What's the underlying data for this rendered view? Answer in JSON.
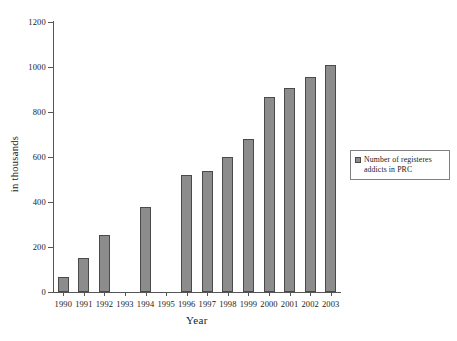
{
  "chart_data": {
    "type": "bar",
    "title": "",
    "xlabel": "Year",
    "ylabel": "in thousands",
    "categories": [
      "1990",
      "1991",
      "1992",
      "1993",
      "1994",
      "1995",
      "1996",
      "1997",
      "1998",
      "1999",
      "2000",
      "2001",
      "2002",
      "2003"
    ],
    "values": [
      68,
      150,
      252,
      null,
      380,
      null,
      520,
      540,
      600,
      681,
      866,
      906,
      955,
      1010
    ],
    "series": [
      {
        "name": "Number of registeres addicts in PRC",
        "values": [
          68,
          150,
          252,
          null,
          380,
          null,
          520,
          540,
          600,
          681,
          866,
          906,
          955,
          1010
        ]
      }
    ],
    "ylim": [
      0,
      1200
    ],
    "yticks": [
      0,
      200,
      400,
      600,
      800,
      1000,
      1200
    ],
    "ytick_labels": [
      "0",
      "200",
      "400",
      "600",
      "800",
      "1000",
      "1200"
    ],
    "grid": false,
    "legend_position": "right",
    "bar_color": "#8c8c8c",
    "bar_edge_color": "#4a4a4a",
    "axis_color": "#555555"
  },
  "legend": {
    "entries": [
      {
        "label_line1": "Number of registeres",
        "label_line2": "addicts in PRC"
      }
    ]
  }
}
